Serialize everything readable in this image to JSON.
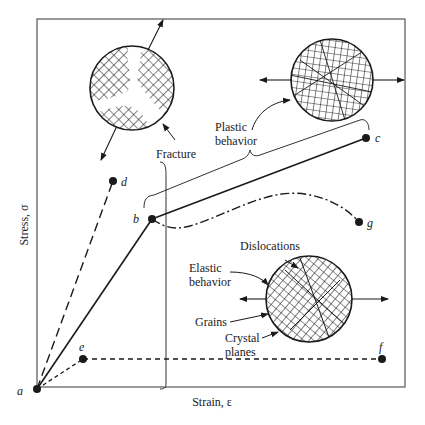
{
  "diagram": {
    "type": "stress-strain curve with microstructure insets",
    "axes": {
      "x_label": "Strain, ε",
      "y_label": "Stress, σ"
    },
    "points": {
      "a": "a",
      "b": "b",
      "c": "c",
      "d": "d",
      "e": "e",
      "f": "f",
      "g": "g"
    },
    "annotations": {
      "fracture": "Fracture",
      "plastic_line1": "Plastic",
      "plastic_line2": "behavior",
      "elastic_line1": "Elastic",
      "elastic_line2": "behavior",
      "dislocations": "Dislocations",
      "grains": "Grains",
      "crystal_line1": "Crystal",
      "crystal_line2": "planes"
    },
    "paths": [
      {
        "name": "a-b",
        "style": "solid"
      },
      {
        "name": "b-c",
        "style": "solid"
      },
      {
        "name": "a-d",
        "style": "long-dash"
      },
      {
        "name": "a-e",
        "style": "short-dash"
      },
      {
        "name": "e-f",
        "style": "short-dash"
      },
      {
        "name": "b-g",
        "style": "dash-dot"
      }
    ],
    "colors": {
      "ink": "#1a1a1a",
      "background": "#ffffff"
    }
  }
}
